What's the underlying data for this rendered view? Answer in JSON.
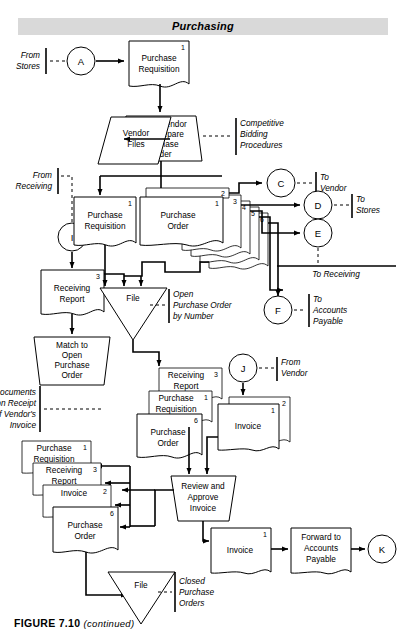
{
  "figure": {
    "title": "Purchasing",
    "caption_bold": "FIGURE 7.10",
    "caption_italic": "(continued)"
  },
  "connectors": {
    "a": "A",
    "c": "C",
    "d": "D",
    "e": "E",
    "f": "F",
    "i": "I",
    "j": "J",
    "k": "K"
  },
  "annotations": {
    "from_stores": [
      "From",
      "Stores"
    ],
    "from_receiving": [
      "From",
      "Receiving"
    ],
    "competitive": [
      "Competitive",
      "Bidding",
      "Procedures"
    ],
    "to_vendor": [
      "To",
      "Vendor"
    ],
    "to_stores": [
      "To",
      "Stores"
    ],
    "to_receiving": "To Receiving",
    "to_accounts_payable": [
      "To",
      "Accounts",
      "Payable"
    ],
    "from_vendor": [
      "From",
      "Vendor"
    ],
    "open_po_by_number": [
      "Open",
      "Purchase Order",
      "by Number"
    ],
    "pull_documents": [
      "Pull Documents",
      "upon Receipt",
      "of Vendor's",
      "Invoice"
    ],
    "closed_po": [
      "Closed",
      "Purchase",
      "Orders"
    ]
  },
  "nodes": {
    "purchase_requisition_top": {
      "lines": [
        "Purchase",
        "Requisition"
      ],
      "copy": "1"
    },
    "select_vendor": {
      "lines": [
        "Select Vendor",
        "and Prepare",
        "Purchase",
        "Order"
      ]
    },
    "vendor_files": {
      "lines": [
        "Vendor",
        "Files"
      ]
    },
    "purchase_requisition_mid": {
      "lines": [
        "Purchase",
        "Requisition"
      ],
      "copy": "1"
    },
    "purchase_order_stack": {
      "lines": [
        "Purchase",
        "Order"
      ],
      "copies": [
        "1",
        "2",
        "3",
        "4",
        "5",
        "6"
      ]
    },
    "receiving_report_left": {
      "lines": [
        "Receiving",
        "Report"
      ],
      "copy": "3"
    },
    "file_open_po": {
      "label": "File"
    },
    "match_to_open_po": {
      "lines": [
        "Match to",
        "Open",
        "Purchase",
        "Order"
      ]
    },
    "pulled_stack": [
      {
        "lines": [
          "Receiving",
          "Report"
        ],
        "copy": "3"
      },
      {
        "lines": [
          "Purchase",
          "Requisition"
        ],
        "copy": "1"
      },
      {
        "lines": [
          "Purchase",
          "Order"
        ],
        "copy": "6"
      }
    ],
    "invoice_stack_top": {
      "lines": [
        "Invoice"
      ],
      "copies": [
        "1",
        "2"
      ]
    },
    "review_approve": {
      "lines": [
        "Review and",
        "Approve",
        "Invoice"
      ]
    },
    "returned_stack": [
      {
        "lines": [
          "Purchase",
          "Requisition"
        ],
        "copy": "1"
      },
      {
        "lines": [
          "Receiving",
          "Report"
        ],
        "copy": "3"
      },
      {
        "lines": [
          "Invoice"
        ],
        "copy": "2"
      },
      {
        "lines": [
          "Purchase",
          "Order"
        ],
        "copy": "6"
      }
    ],
    "invoice_final": {
      "lines": [
        "Invoice"
      ],
      "copy": "1"
    },
    "forward_ap": {
      "lines": [
        "Forward to",
        "Accounts",
        "Payable"
      ]
    },
    "file_closed_po": {
      "label": "File"
    }
  },
  "colors": {
    "title_band": "#d9d9d9",
    "line": "#000000",
    "shape_fill": "#ffffff"
  }
}
